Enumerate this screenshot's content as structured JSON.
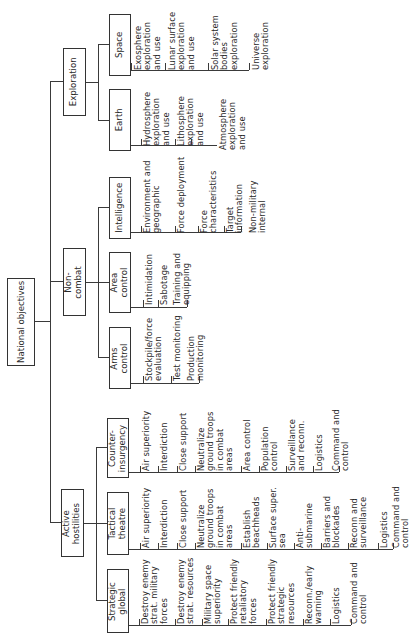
{
  "root": {
    "label": "National objectives"
  },
  "level1": [
    {
      "id": "exploration",
      "label": "Exploration"
    },
    {
      "id": "non_combat",
      "label": "Non-\ncombat"
    },
    {
      "id": "active_hostilities",
      "label": "Active\nhostilities"
    }
  ],
  "level2": {
    "space": {
      "label": "Space",
      "items": [
        "Exosphere\nexploration\nand use",
        "Lunar surface\nexploration\nand use",
        "Solar system\nbodies\nexploration",
        "Universe\nexploration"
      ]
    },
    "earth": {
      "label": "Earth",
      "items": [
        "Hydrosphere\nexploration\nand use",
        "Lithosphere\nexploration\nand use",
        "Atmosphere\nexploration\nand use"
      ]
    },
    "intelligence": {
      "label": "Intelligence",
      "items": [
        "Environment and\ngeographic",
        "Force deployment",
        "Force\ncharacteristics",
        "Target\ninformation",
        "Non-military\ninternal"
      ]
    },
    "area_control": {
      "label": "Area\ncontrol",
      "items": [
        "Intimidation",
        "Sabotage",
        "Training and\nequipping"
      ]
    },
    "arms_control": {
      "label": "Arms\ncontrol",
      "items": [
        "Stockpile/force\nevaluation",
        "Test monitoring",
        "Production\nmonitoring"
      ]
    },
    "counter_insurgency": {
      "label": "Counter-\ninsurgency",
      "items": [
        "Air superiority",
        "Interdiction",
        "Close support",
        "Neutralize\nground troops\nin combat\nareas",
        "Area control",
        "Population\ncontrol",
        "Surveillance\nand reconn.",
        "Logistics",
        "Command and\ncontrol"
      ]
    },
    "tactical_theatre": {
      "label": "Tactical\ntheatre",
      "items": [
        "Air superiority",
        "Interdiction",
        "Close support",
        "Neutralize\nground troops\nin combat\nareas",
        "Establish\nbeachheads",
        "Surface super.\nsea",
        "Anti-\nsubmarine",
        "Barriers and\nblockades",
        "Reconn and\nsurveillance",
        "Logistics",
        "Command and\ncontrol"
      ]
    },
    "strategic_global": {
      "label": "Strategic\nglobal",
      "items": [
        "Destroy enemy\nstrat. military\nforces",
        "Destroy enemy\nstrat. resources",
        "Military space\nsuperiority",
        "Protect friendly\nretaliatory\nforces",
        "Protect friendly\nstrategic\nresources",
        "Reconn./early\nwarning",
        "Logistics",
        "Command and\ncontrol"
      ]
    }
  }
}
